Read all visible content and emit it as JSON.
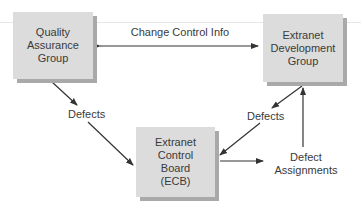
{
  "diagram": {
    "nodes": [
      {
        "id": "qa",
        "lines": [
          "Quality",
          "Assurance",
          "Group"
        ]
      },
      {
        "id": "dev",
        "lines": [
          "Extranet",
          "Development",
          "Group"
        ]
      },
      {
        "id": "ecb",
        "lines": [
          "Extranet",
          "Control",
          "Board",
          "(ECB)"
        ]
      }
    ],
    "edges": [
      {
        "from": "qa",
        "to": "dev",
        "label": "Change Control Info",
        "bidirectional": true
      },
      {
        "from": "qa",
        "to": "ecb",
        "label": "Defects"
      },
      {
        "from": "dev",
        "to": "ecb",
        "label": "Defects"
      },
      {
        "from": "ecb",
        "to": "dev",
        "label_lines": [
          "Defect",
          "Assignments"
        ]
      }
    ],
    "colors": {
      "box": "#dcdcdc",
      "shadow": "#a9a9a9",
      "arrow": "#333333"
    }
  }
}
